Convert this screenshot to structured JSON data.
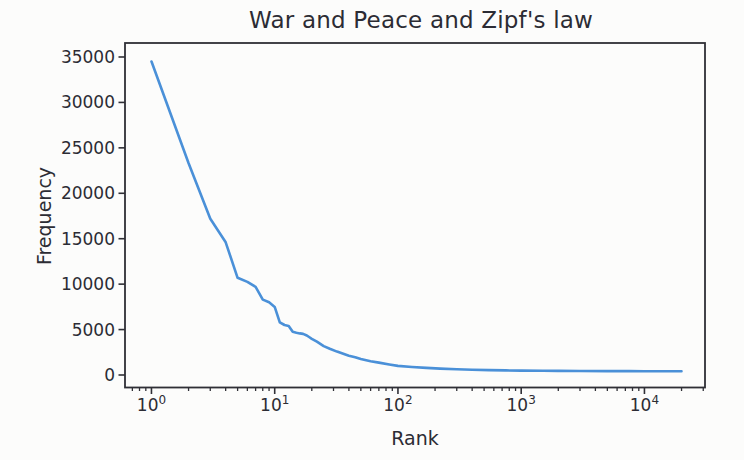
{
  "figure": {
    "background_color": "#fcfcfb"
  },
  "chart_data": {
    "type": "line",
    "title": "War and Peace and Zipf's law",
    "xlabel": "Rank",
    "ylabel": "Frequency",
    "xscale": "log",
    "yscale": "linear",
    "grid": false,
    "legend": "none",
    "xlim": [
      0.61,
      31000
    ],
    "ylim": [
      -1376,
      36540
    ],
    "x_tick_base": "10",
    "x_tick_exponents": [
      0,
      1,
      2,
      3,
      4
    ],
    "y_ticks": [
      0,
      5000,
      10000,
      15000,
      20000,
      25000,
      30000,
      35000
    ],
    "line_color": "#4a90d8",
    "text_color": "#2c2c34",
    "axis_color": "#2f2f36",
    "series": [
      {
        "name": "word frequency vs rank",
        "x": [
          1,
          2,
          3,
          4,
          5,
          6,
          7,
          8,
          9,
          10,
          11,
          12,
          13,
          14,
          15,
          16,
          17,
          18,
          19,
          20,
          22,
          25,
          28,
          32,
          36,
          40,
          45,
          50,
          60,
          70,
          85,
          100,
          130,
          170,
          220,
          300,
          400,
          550,
          750,
          1000,
          1500,
          2000,
          3000,
          5000,
          7500,
          10000,
          15000,
          20000
        ],
        "y": [
          34500,
          23300,
          17200,
          14600,
          10700,
          10250,
          9700,
          8300,
          8000,
          7500,
          5800,
          5500,
          5400,
          4750,
          4650,
          4580,
          4520,
          4380,
          4180,
          3980,
          3680,
          3180,
          2880,
          2580,
          2330,
          2120,
          1960,
          1750,
          1520,
          1360,
          1160,
          1000,
          880,
          780,
          700,
          630,
          575,
          535,
          505,
          485,
          465,
          455,
          445,
          432,
          426,
          421,
          414,
          410
        ]
      }
    ]
  }
}
